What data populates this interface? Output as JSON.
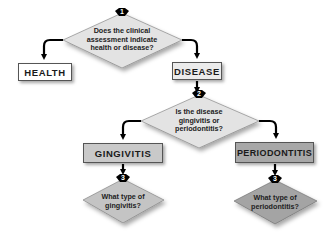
{
  "diagram": {
    "type": "flowchart",
    "colors": {
      "diamond_light": "#e3e3e3",
      "diamond_mid": "#c4c4c4",
      "diamond_dark": "#a4a4a4",
      "box_health": "#ffffff",
      "box_disease": "#ebebeb",
      "box_gingivitis": "#c9c9c9",
      "box_periodontitis": "#a8a8a8",
      "badge": "#000000",
      "arrow": "#000000"
    },
    "decisions": [
      {
        "step": "1",
        "question": "Does the clinical\nassessment indicate\nhealth or disease?"
      },
      {
        "step": "2",
        "question": "Is the disease\ngingivitis or\nperiodontitis?"
      },
      {
        "step": "3",
        "question": "What type of\ngingivitis?"
      },
      {
        "step": "3",
        "question": "What type of\nperiodontitis?"
      }
    ],
    "outcomes": {
      "health": "HEALTH",
      "disease": "DISEASE",
      "gingivitis": "GINGIVITIS",
      "periodontitis": "PERIODONTITIS"
    },
    "connections": [
      {
        "from": "decision-1",
        "to": "health"
      },
      {
        "from": "decision-1",
        "to": "disease"
      },
      {
        "from": "disease",
        "to": "decision-2"
      },
      {
        "from": "decision-2",
        "to": "gingivitis"
      },
      {
        "from": "decision-2",
        "to": "periodontitis"
      },
      {
        "from": "gingivitis",
        "to": "decision-3-gingivitis"
      },
      {
        "from": "periodontitis",
        "to": "decision-3-periodontitis"
      }
    ]
  }
}
